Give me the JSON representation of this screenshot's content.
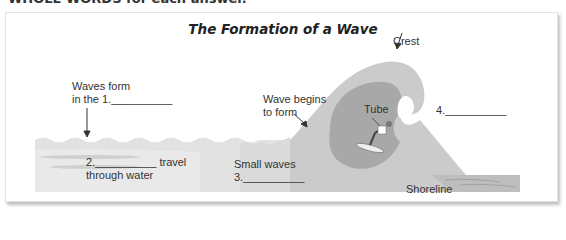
{
  "header": {
    "cut_off_text": "WHOLE WORDS for each answer."
  },
  "diagram": {
    "title": "The Formation of a Wave",
    "labels": {
      "crest": "Crest",
      "waves_form_line1": "Waves form",
      "waves_form_line2": "in the 1.__________",
      "wave_begins_line1": "Wave begins",
      "wave_begins_line2": "to form",
      "tube": "Tube",
      "blank4": "4.__________",
      "travel_line1": "2.__________ travel",
      "travel_line2": "through water",
      "small_waves_line1": "Small waves",
      "small_waves_line2": "3.__________",
      "shoreline": "Shoreline"
    },
    "colors": {
      "sea": "#dcdcdc",
      "wave_outer": "#c8c8c8",
      "tube": "#a9a9a9",
      "shore": "#b8b8b8"
    }
  }
}
